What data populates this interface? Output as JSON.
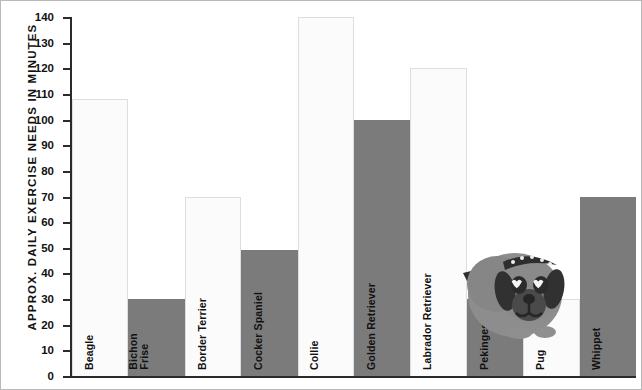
{
  "chart_data": {
    "type": "bar",
    "title": "",
    "xlabel": "",
    "ylabel": "APPROX. DAILY EXERCISE NEEDS IN MINUTES",
    "ylim": [
      0,
      140
    ],
    "ytick_step": 10,
    "yticks": [
      140,
      130,
      120,
      110,
      100,
      90,
      80,
      70,
      60,
      50,
      40,
      30,
      20,
      10,
      0
    ],
    "grid": false,
    "legend": null,
    "categories": [
      "Beagle",
      "Bichon\nFrise",
      "Border Terrier",
      "Cocker Spaniel",
      "Collie",
      "Golden Retriever",
      "Labrador Retriever",
      "Pekingese",
      "Pug",
      "Whippet"
    ],
    "values": [
      108,
      30,
      70,
      49,
      140,
      100,
      120,
      30,
      30,
      70
    ],
    "bar_styles": [
      "light",
      "dark",
      "light",
      "dark",
      "light",
      "dark",
      "light",
      "dark",
      "light",
      "dark"
    ],
    "colors": {
      "light_bar": "#FBFBFB",
      "dark_bar": "#7B7B7B",
      "axis": "#2B2B2B",
      "text": "#111111",
      "background": "#FFFFFF",
      "dog_body": "#8A8A8A",
      "dog_dark": "#3A3A3A"
    },
    "annotations": [
      {
        "name": "dog-illustration",
        "description": "cartoon pug dog with studded collar"
      }
    ]
  }
}
